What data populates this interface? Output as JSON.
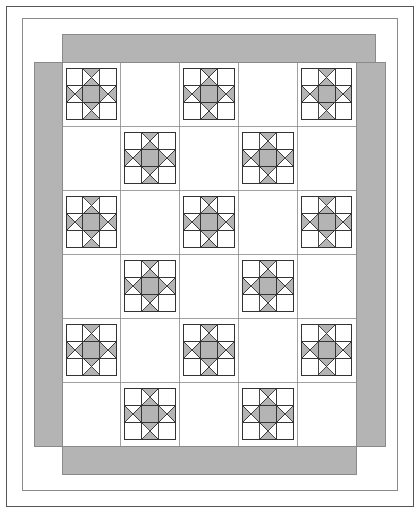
{
  "diagram": {
    "type": "quilt-block-layout",
    "canvas": {
      "width": 419,
      "height": 512,
      "background": "#ffffff"
    },
    "colors": {
      "background": "#ffffff",
      "fabric_light": "#ffffff",
      "fabric_medium": "#b4b4b4",
      "border_fabric": "#b4b4b4",
      "outline": "#444444",
      "grid_line": "#8a8a8a",
      "frame_line": "#555555",
      "block_outline": "#333333"
    },
    "outer_frame": {
      "name": "page-frame",
      "x": 6,
      "y": 6,
      "width": 407,
      "height": 500,
      "stroke": "#555555",
      "stroke_width": 1,
      "fill": "#ffffff"
    },
    "inner_frame": {
      "name": "quilt-outer-edge",
      "x": 22,
      "y": 18,
      "width": 375,
      "height": 472,
      "stroke": "#8a8a8a",
      "stroke_width": 1,
      "fill": "#ffffff"
    },
    "border_strips": {
      "note": "Pinwheel / courthouse-steps rotation: each strip overlaps the next clockwise",
      "width": 28,
      "strips": [
        {
          "name": "border-strip-top",
          "x": 62,
          "y": 34,
          "width": 313,
          "height": 28
        },
        {
          "name": "border-strip-right",
          "x": 356,
          "y": 62,
          "width": 29,
          "height": 384
        },
        {
          "name": "border-strip-bottom",
          "x": 62,
          "y": 446,
          "width": 294,
          "height": 28
        },
        {
          "name": "border-strip-left",
          "x": 34,
          "y": 62,
          "width": 28,
          "height": 384
        }
      ]
    },
    "quilt_body": {
      "name": "quilt-center-field",
      "x": 62,
      "y": 62,
      "width": 294,
      "height": 384,
      "columns": 5,
      "rows": 6,
      "cell_width": 58.8,
      "cell_height": 64.0,
      "grid_visible": true
    },
    "block": {
      "name": "ohio-star-block",
      "pattern_name": "Ohio Star",
      "units": 3,
      "size_ratio": 0.86,
      "unit_layout": [
        [
          "corner-plain",
          "hourglass-top",
          "corner-plain"
        ],
        [
          "hourglass-left",
          "center-square",
          "hourglass-right"
        ],
        [
          "corner-plain",
          "hourglass-bottom",
          "corner-plain"
        ]
      ],
      "center_fill": "#b4b4b4",
      "corner_fill": "#ffffff",
      "hourglass_fill_a": "#b4b4b4",
      "hourglass_fill_b": "#ffffff",
      "outline": "#333333"
    },
    "star_placement": {
      "note": "Alternating checkerboard — odd rows place stars in columns 1,3,5; even rows in columns 2,4",
      "rows": [
        {
          "row": 1,
          "columns": [
            1,
            3,
            5
          ]
        },
        {
          "row": 2,
          "columns": [
            2,
            4
          ]
        },
        {
          "row": 3,
          "columns": [
            1,
            3,
            5
          ]
        },
        {
          "row": 4,
          "columns": [
            2,
            4
          ]
        },
        {
          "row": 5,
          "columns": [
            1,
            3,
            5
          ]
        },
        {
          "row": 6,
          "columns": [
            2,
            4
          ]
        }
      ],
      "total_stars": 15
    }
  }
}
